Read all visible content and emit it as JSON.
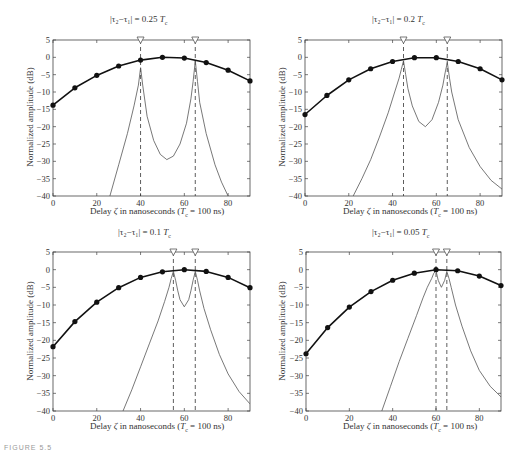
{
  "figure_label": "FIGURE 5.5",
  "chart_data": [
    {
      "type": "line",
      "title": "|τ2−τ1| = 0.25 Tc",
      "xlabel": "Delay ζ in nanoseconds (Tc = 100 ns)",
      "ylabel": "Normalized amplitude (dB)",
      "xlim": [
        0,
        90
      ],
      "ylim": [
        -40,
        5
      ],
      "xticks": [
        0,
        20,
        40,
        60,
        80
      ],
      "yticks": [
        5,
        0,
        -5,
        -10,
        -15,
        -20,
        -25,
        -30,
        -35,
        -40
      ],
      "markers": [
        40,
        65
      ],
      "series": [
        {
          "name": "estimated (dots)",
          "style": "thick line with markers",
          "x": [
            0,
            10,
            20,
            30,
            40,
            50,
            60,
            70,
            80,
            90
          ],
          "values": [
            -13.8,
            -8.8,
            -5.2,
            -2.5,
            -0.8,
            0,
            -0.2,
            -1.5,
            -3.7,
            -6.8
          ]
        },
        {
          "name": "two-path spectrum",
          "style": "thin line",
          "x": [
            26,
            30,
            34,
            37,
            39,
            40,
            41,
            43,
            46,
            49,
            52,
            55,
            58,
            61,
            63,
            64,
            65,
            66,
            67,
            70,
            74,
            77,
            80
          ],
          "values": [
            -40,
            -31,
            -22,
            -14,
            -8,
            -3,
            -8,
            -17,
            -24,
            -28,
            -29.5,
            -28.5,
            -25,
            -19,
            -12,
            -7,
            -1,
            -7,
            -13,
            -22,
            -31,
            -36,
            -40
          ]
        }
      ]
    },
    {
      "type": "line",
      "title": "|τ2−τ1| = 0.2 Tc",
      "xlabel": "Delay ζ in nanoseconds (Tc = 100 ns)",
      "ylabel": "Normalized amplitude (dB)",
      "xlim": [
        0,
        90
      ],
      "ylim": [
        -40,
        5
      ],
      "xticks": [
        0,
        20,
        40,
        60,
        80
      ],
      "yticks": [
        5,
        0,
        -5,
        -10,
        -15,
        -20,
        -25,
        -30,
        -35,
        -40
      ],
      "markers": [
        45,
        65
      ],
      "series": [
        {
          "name": "estimated (dots)",
          "style": "thick line with markers",
          "x": [
            0,
            10,
            20,
            30,
            40,
            50,
            60,
            70,
            80,
            90
          ],
          "values": [
            -16.5,
            -11,
            -6.5,
            -3.3,
            -1.2,
            -0.1,
            -0.1,
            -1.2,
            -3.3,
            -6.5
          ]
        },
        {
          "name": "two-path spectrum",
          "style": "thin line",
          "x": [
            22,
            26,
            30,
            34,
            38,
            41,
            43,
            44,
            45,
            46,
            47,
            49,
            52,
            55,
            58,
            61,
            63,
            64,
            65,
            66,
            67,
            70,
            75,
            80,
            85,
            90
          ],
          "values": [
            -40,
            -35,
            -29.5,
            -23,
            -16,
            -10,
            -6,
            -3.5,
            -1,
            -5,
            -9,
            -14,
            -18.5,
            -20,
            -18,
            -13,
            -8,
            -4.5,
            -1.5,
            -6,
            -10,
            -18,
            -26,
            -31.5,
            -35.5,
            -38
          ]
        }
      ]
    },
    {
      "type": "line",
      "title": "|τ2−τ1| = 0.1 Tc",
      "xlabel": "Delay ζ in nanoseconds (Tc = 100 ns)",
      "ylabel": "Normalized amplitude (dB)",
      "xlim": [
        0,
        90
      ],
      "ylim": [
        -40,
        5
      ],
      "xticks": [
        0,
        20,
        40,
        60,
        80
      ],
      "yticks": [
        5,
        0,
        -5,
        -10,
        -15,
        -20,
        -25,
        -30,
        -35,
        -40
      ],
      "markers": [
        55,
        65
      ],
      "series": [
        {
          "name": "estimated (dots)",
          "style": "thick line with markers",
          "x": [
            0,
            10,
            20,
            30,
            40,
            50,
            60,
            70,
            80,
            90
          ],
          "values": [
            -21.8,
            -14.7,
            -9.2,
            -5.1,
            -2.2,
            -0.6,
            0,
            -0.5,
            -2.2,
            -5.1
          ]
        },
        {
          "name": "two-path spectrum",
          "style": "thin line",
          "x": [
            32,
            36,
            40,
            44,
            48,
            51,
            53,
            54,
            55,
            56,
            57,
            58,
            60,
            62,
            63,
            64,
            65,
            66,
            67,
            69,
            72,
            76,
            80,
            85,
            90
          ],
          "values": [
            -40,
            -34,
            -27.5,
            -21,
            -14.5,
            -9,
            -5,
            -2.5,
            -0.5,
            -3,
            -6,
            -8.5,
            -10.5,
            -8.5,
            -6,
            -3,
            -0.5,
            -3,
            -6,
            -11,
            -17,
            -24,
            -29.5,
            -34.5,
            -38
          ]
        }
      ]
    },
    {
      "type": "line",
      "title": "|τ2−τ1| = 0.05 Tc",
      "xlabel": "Delay ζ in nanoseconds (Tc = 100 ns)",
      "ylabel": "Normalized amplitude (dB)",
      "xlim": [
        0,
        90
      ],
      "ylim": [
        -40,
        5
      ],
      "xticks": [
        0,
        20,
        40,
        60,
        80
      ],
      "yticks": [
        5,
        0,
        -5,
        -10,
        -15,
        -20,
        -25,
        -30,
        -35,
        -40
      ],
      "markers": [
        60,
        65
      ],
      "series": [
        {
          "name": "estimated (dots)",
          "style": "thick line with markers",
          "x": [
            0,
            10,
            20,
            30,
            40,
            50,
            60,
            70,
            80,
            90
          ],
          "values": [
            -23.8,
            -16.4,
            -10.6,
            -6.2,
            -3,
            -1,
            0,
            -0.3,
            -1.8,
            -4.5
          ]
        },
        {
          "name": "two-path spectrum",
          "style": "thin line",
          "x": [
            35,
            39,
            43,
            47,
            51,
            54,
            56,
            58,
            59,
            60,
            61,
            62.5,
            64,
            65,
            66,
            67,
            69,
            72,
            76,
            80,
            85,
            90
          ],
          "values": [
            -40,
            -33,
            -26,
            -19.5,
            -13,
            -8,
            -5,
            -2.5,
            -1,
            -0.3,
            -3,
            -5,
            -3,
            -0.5,
            -2.5,
            -5,
            -10,
            -16,
            -23,
            -28.5,
            -33,
            -36
          ]
        }
      ]
    }
  ],
  "panels": [
    {
      "title_abs": "|τ",
      "title": "|τ₂−τ₁| = 0.25 ",
      "title_tc": "T",
      "title_sub": "c",
      "xlabel_pre": "Delay ",
      "xlabel_zeta": "ζ",
      "xlabel_mid": " in nanoseconds (",
      "xlabel_tc": "T",
      "xlabel_sub": "c",
      "xlabel_post": " = 100 ns)",
      "ylabel": "Normalized amplitude (dB)"
    },
    {
      "title": "|τ₂−τ₁| = 0.2 ",
      "title_tc": "T",
      "title_sub": "c",
      "xlabel_pre": "Delay ",
      "xlabel_zeta": "ζ",
      "xlabel_mid": " in nanoseconds (",
      "xlabel_tc": "T",
      "xlabel_sub": "c",
      "xlabel_post": " = 100 ns)",
      "ylabel": "Normalized amplitude (dB)"
    },
    {
      "title": "|τ₂−τ₁| = 0.1 ",
      "title_tc": "T",
      "title_sub": "c",
      "xlabel_pre": "Delay ",
      "xlabel_zeta": "ζ",
      "xlabel_mid": " in nanoseconds (",
      "xlabel_tc": "T",
      "xlabel_sub": "c",
      "xlabel_post": " = 100 ns)",
      "ylabel": "Normalized amplitude (dB)"
    },
    {
      "title": "|τ₂−τ₁| = 0.05 ",
      "title_tc": "T",
      "title_sub": "c",
      "xlabel_pre": "Delay ",
      "xlabel_zeta": "ζ",
      "xlabel_mid": " in nanoseconds (",
      "xlabel_tc": "T",
      "xlabel_sub": "c",
      "xlabel_post": " = 100 ns)",
      "ylabel": "Normalized amplitude (dB)"
    }
  ]
}
